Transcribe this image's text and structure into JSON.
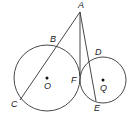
{
  "diagram": {
    "type": "geometry",
    "stroke_color": "#333333",
    "circles": [
      {
        "name": "circle-O",
        "center_label": "O",
        "cx": 47,
        "cy": 78,
        "r": 33
      },
      {
        "name": "circle-Q",
        "center_label": "Q",
        "cx": 103,
        "cy": 80,
        "r": 23
      }
    ],
    "segments": [
      {
        "name": "secant-AC",
        "from": "A",
        "to": "C",
        "x1": 80,
        "y1": 12,
        "x2": 20,
        "y2": 100
      },
      {
        "name": "tangent-AF",
        "from": "A",
        "to": "F",
        "x1": 80,
        "y1": 12,
        "x2": 80,
        "y2": 76
      },
      {
        "name": "secant-AE",
        "from": "A",
        "to": "E",
        "x1": 80,
        "y1": 12,
        "x2": 96,
        "y2": 101
      }
    ],
    "points": [
      {
        "label": "A",
        "x": 78,
        "y": 8
      },
      {
        "label": "B",
        "x": 50,
        "y": 42
      },
      {
        "label": "C",
        "x": 11,
        "y": 107
      },
      {
        "label": "D",
        "x": 95,
        "y": 55
      },
      {
        "label": "F",
        "x": 71,
        "y": 83
      },
      {
        "label": "E",
        "x": 94,
        "y": 111
      },
      {
        "label": "O",
        "x": 44,
        "y": 89
      },
      {
        "label": "Q",
        "x": 100,
        "y": 91
      }
    ],
    "center_dots": [
      {
        "name": "center-O",
        "x": 47,
        "y": 78
      },
      {
        "name": "center-Q",
        "x": 103,
        "y": 80
      }
    ]
  }
}
